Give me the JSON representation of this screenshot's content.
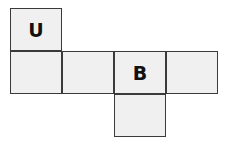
{
  "diagram": {
    "type": "cube-net",
    "faces": [
      {
        "id": "top-left",
        "label": "U",
        "col": 0,
        "row": 0
      },
      {
        "id": "row1-col0",
        "label": "",
        "col": 0,
        "row": 1
      },
      {
        "id": "row1-col1",
        "label": "",
        "col": 1,
        "row": 1
      },
      {
        "id": "row1-col2",
        "label": "B",
        "col": 2,
        "row": 1
      },
      {
        "id": "row1-col3",
        "label": "",
        "col": 3,
        "row": 1
      },
      {
        "id": "bottom",
        "label": "",
        "col": 2,
        "row": 2
      }
    ],
    "colors": {
      "face_fill": "#f0f0f0",
      "border": "#3a3a3a",
      "text": "#111111"
    }
  }
}
